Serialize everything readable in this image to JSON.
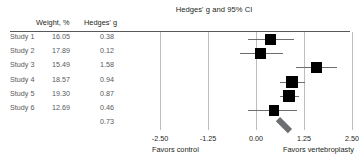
{
  "chart_data": {
    "type": "forest",
    "title": "Hedges' g and 95% CI",
    "xlabel": "",
    "ylabel": "",
    "xlim": [
      -2.5,
      2.5
    ],
    "xticks": [
      "-2.50",
      "-1.25",
      "0.00",
      "1.25",
      "2.50"
    ],
    "xtick_values": [
      -2.5,
      -1.25,
      0,
      1.25,
      2.5
    ],
    "grid": true,
    "legend": "none",
    "axis_left_label": "Favors control",
    "axis_right_label": "Favors vertebroplasty",
    "columns": [
      "",
      "Weight, %",
      "Hedges' g"
    ],
    "rows": [
      {
        "label": "Study 1",
        "weight": "16.05",
        "es": "0.38",
        "es_value": 0.38,
        "ci_low": -0.22,
        "ci_high": 0.98,
        "weight_value": 16.05
      },
      {
        "label": "Study 2",
        "weight": "17.89",
        "es": "0.12",
        "es_value": 0.12,
        "ci_low": -0.42,
        "ci_high": 0.7,
        "weight_value": 17.89
      },
      {
        "label": "Study 3",
        "weight": "15.49",
        "es": "1.58",
        "es_value": 1.58,
        "ci_low": 1.04,
        "ci_high": 2.1,
        "weight_value": 15.49
      },
      {
        "label": "Study 4",
        "weight": "18.57",
        "es": "0.94",
        "es_value": 0.94,
        "ci_low": 0.62,
        "ci_high": 1.28,
        "weight_value": 18.57
      },
      {
        "label": "Study 5",
        "weight": "19.30",
        "es": "0.87",
        "es_value": 0.87,
        "ci_low": 0.62,
        "ci_high": 1.12,
        "weight_value": 19.3
      },
      {
        "label": "Study 6",
        "weight": "12.69",
        "es": "0.46",
        "es_value": 0.46,
        "ci_low": -0.22,
        "ci_high": 1.06,
        "weight_value": 12.69
      }
    ],
    "summary": {
      "label": "",
      "weight": "",
      "es": "0.73",
      "es_value": 0.73,
      "ci_low": 0.42,
      "ci_high": 1.04
    },
    "colors": {
      "marker": "#000000",
      "summary": "#6d6e71",
      "grid": "#bcbec0",
      "rule": "#58595b",
      "text": "#231f20",
      "table_text": "#58595b"
    }
  }
}
